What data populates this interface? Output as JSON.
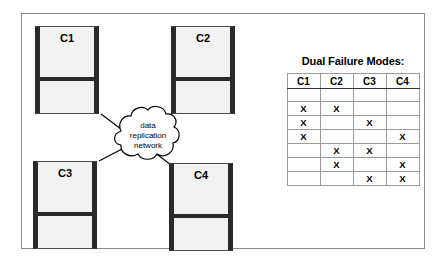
{
  "diagram": {
    "cloud": {
      "line1": "data",
      "line2": "replication",
      "line3": "network"
    },
    "nodes": [
      {
        "id": "c1",
        "label": "C1",
        "failed": true
      },
      {
        "id": "c2",
        "label": "C2",
        "failed": false
      },
      {
        "id": "c3",
        "label": "C3",
        "failed": false
      },
      {
        "id": "c4",
        "label": "C4",
        "failed": true
      }
    ]
  },
  "panel": {
    "title": "Dual Failure Modes:",
    "table": {
      "headers": [
        "C1",
        "C2",
        "C3",
        "C4"
      ],
      "mark": "X",
      "rows": [
        [
          "",
          "",
          "",
          ""
        ],
        [
          "X",
          "X",
          "",
          ""
        ],
        [
          "X",
          "",
          "X",
          ""
        ],
        [
          "X",
          "",
          "",
          "X"
        ],
        [
          "",
          "X",
          "X",
          ""
        ],
        [
          "",
          "X",
          "",
          "X"
        ],
        [
          "",
          "",
          "X",
          "X"
        ]
      ]
    }
  },
  "colors": {
    "frame": "#8a8a8a",
    "node_edge": "#2a2a2a",
    "node_fill": "#f2f2f2",
    "line": "#000000",
    "grid": "#9a9a9a"
  }
}
